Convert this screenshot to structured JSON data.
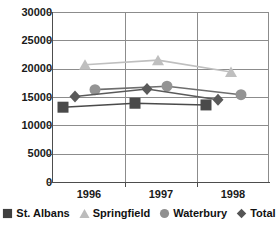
{
  "chart_data": {
    "type": "line",
    "title": "",
    "xlabel": "",
    "ylabel": "",
    "categories": [
      "1996",
      "1997",
      "1998"
    ],
    "ylim": [
      0,
      30000
    ],
    "ytick_labels": [
      "0",
      "5000",
      "10000",
      "15000",
      "20000",
      "25000",
      "30000"
    ],
    "ytick_values": [
      0,
      5000,
      10000,
      15000,
      20000,
      25000,
      30000
    ],
    "grid": true,
    "legend_position": "bottom",
    "series": [
      {
        "name": "St. Albans",
        "marker": "square",
        "color": "#4a4a4a",
        "line_color": "#4a4a4a",
        "values": [
          13200,
          13900,
          13600
        ]
      },
      {
        "name": "Springfield",
        "marker": "triangle",
        "color": "#bfbfbf",
        "line_color": "#bfbfbf",
        "values": [
          20700,
          21500,
          19400
        ]
      },
      {
        "name": "Waterbury",
        "marker": "circle",
        "color": "#949494",
        "line_color": "#6e6e6e",
        "values": [
          16300,
          16900,
          15400
        ]
      },
      {
        "name": "Total",
        "marker": "diamond",
        "color": "#5a5a5a",
        "line_color": "#5a5a5a",
        "values": [
          15100,
          16400,
          14500
        ]
      }
    ]
  },
  "axis": {
    "y_labels": [
      "30000",
      "25000",
      "20000",
      "15000",
      "10000",
      "5000",
      "0"
    ],
    "x_labels": [
      "1996",
      "1997",
      "1998"
    ]
  },
  "legend": {
    "items": [
      {
        "label": "St. Albans",
        "marker": "square",
        "color": "#3f3f3f"
      },
      {
        "label": "Springfield",
        "marker": "triangle",
        "color": "#bcbcbc"
      },
      {
        "label": "Waterbury",
        "marker": "circle",
        "color": "#8f8f8f"
      },
      {
        "label": "Total",
        "marker": "diamond",
        "color": "#555555"
      }
    ]
  }
}
